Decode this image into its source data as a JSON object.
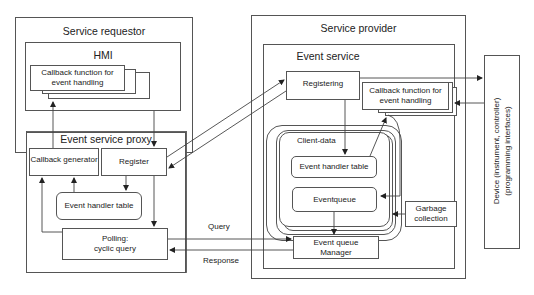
{
  "diagram": {
    "service_requestor": {
      "title": "Service requestor",
      "hmi": {
        "title": "HMI",
        "callback": "Callback function for\nevent handling",
        "callback_line1": "Callback function for",
        "callback_line2": "event handling"
      },
      "proxy": {
        "title": "Event service proxy",
        "callback_generator": "Callback generator",
        "register": "Register",
        "event_handler_table": "Event handler table",
        "polling_line1": "Polling:",
        "polling_line2": "cyclic query"
      }
    },
    "service_provider": {
      "title": "Service provider",
      "event_service": {
        "title": "Event service",
        "registering": "Registering",
        "callback_line1": "Callback function for",
        "callback_line2": "event handling",
        "client_data": "Client-data",
        "event_handler_table": "Event handler table",
        "eventqueue": "Eventqueue",
        "garbage_line1": "Garbage",
        "garbage_line2": "collection",
        "eq_manager_line1": "Event queue",
        "eq_manager_line2": "Manager"
      }
    },
    "connectors": {
      "query": "Query",
      "response": "Response"
    },
    "device": {
      "line1": "Device (instrument, controller)",
      "line2": "(programming interfaces)"
    }
  }
}
